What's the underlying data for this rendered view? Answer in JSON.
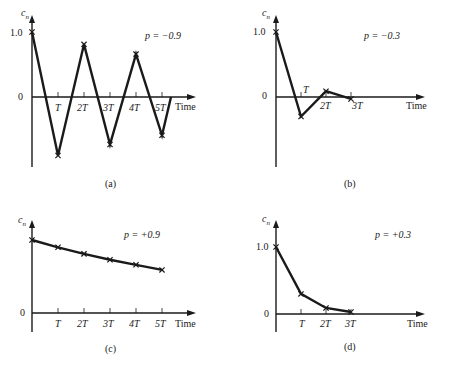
{
  "figure": {
    "panels": [
      {
        "id": "a",
        "caption": "(a)",
        "p_label": "p = −0.9",
        "ylabel": "c_n",
        "xlabel": "Time",
        "y_tick_one": "1.0",
        "y_tick_zero": "0",
        "x_ticks": [
          "T",
          "2T",
          "3T",
          "4T",
          "5T"
        ]
      },
      {
        "id": "b",
        "caption": "(b)",
        "p_label": "p = −0.3",
        "ylabel": "c_n",
        "xlabel": "Time",
        "y_tick_one": "1.0",
        "y_tick_zero": "0",
        "x_ticks": [
          "T",
          "2T",
          "3T"
        ]
      },
      {
        "id": "c",
        "caption": "(c)",
        "p_label": "p = +0.9",
        "ylabel": "c_n",
        "xlabel": "Time",
        "y_tick_zero": "0",
        "x_ticks": [
          "T",
          "2T",
          "3T",
          "4T",
          "5T"
        ]
      },
      {
        "id": "d",
        "caption": "(d)",
        "p_label": "p = +0.3",
        "ylabel": "c_n",
        "xlabel": "Time",
        "y_tick_one": "1.0",
        "y_tick_zero": "0",
        "x_ticks": [
          "T",
          "2T",
          "3T"
        ]
      }
    ]
  },
  "chart_data": [
    {
      "type": "line",
      "title": "(a)",
      "annotation": "p = -0.9",
      "xlabel": "Time",
      "ylabel": "c_n",
      "categories": [
        "0",
        "T",
        "2T",
        "3T",
        "4T",
        "5T"
      ],
      "values": [
        1.0,
        -0.9,
        0.81,
        -0.73,
        0.66,
        -0.59
      ],
      "ylim": [
        -1.1,
        1.2
      ],
      "grid": false
    },
    {
      "type": "line",
      "title": "(b)",
      "annotation": "p = -0.3",
      "xlabel": "Time",
      "ylabel": "c_n",
      "categories": [
        "0",
        "T",
        "2T",
        "3T"
      ],
      "values": [
        1.0,
        -0.3,
        0.09,
        -0.03
      ],
      "ylim": [
        -1.1,
        1.2
      ],
      "grid": false
    },
    {
      "type": "line",
      "title": "(c)",
      "annotation": "p = +0.9",
      "xlabel": "Time",
      "ylabel": "c_n",
      "categories": [
        "0",
        "T",
        "2T",
        "3T",
        "4T",
        "5T"
      ],
      "values": [
        1.0,
        0.9,
        0.81,
        0.73,
        0.66,
        0.59
      ],
      "ylim": [
        -0.1,
        1.4
      ],
      "grid": false
    },
    {
      "type": "line",
      "title": "(d)",
      "annotation": "p = +0.3",
      "xlabel": "Time",
      "ylabel": "c_n",
      "categories": [
        "0",
        "T",
        "2T",
        "3T"
      ],
      "values": [
        1.0,
        0.3,
        0.09,
        0.03
      ],
      "ylim": [
        -0.1,
        1.4
      ],
      "grid": false
    }
  ]
}
